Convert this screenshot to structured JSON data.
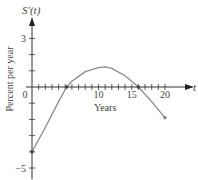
{
  "chart_data": {
    "type": "line",
    "title": "",
    "ylabel": "Percent per year",
    "xlabel": "Years",
    "y_axis_name": "S′(t)",
    "x_axis_name": "t",
    "xlim": [
      0,
      24
    ],
    "ylim": [
      -5.5,
      4
    ],
    "x_ticks": [
      0,
      1,
      2,
      3,
      4,
      5,
      6,
      7,
      8,
      9,
      10,
      11,
      12,
      13,
      14,
      15,
      16,
      17,
      18,
      19,
      20
    ],
    "x_tick_labels": [
      {
        "value": 0,
        "label": "0"
      },
      {
        "value": 10,
        "label": "10"
      },
      {
        "value": 15,
        "label": "15"
      },
      {
        "value": 20,
        "label": "20"
      }
    ],
    "y_ticks": [
      -5,
      -4,
      -3,
      -2,
      -1,
      0,
      1,
      2,
      3
    ],
    "y_tick_labels": [
      {
        "value": 3,
        "label": "3"
      },
      {
        "value": -5,
        "label": "−5"
      }
    ],
    "grid": false,
    "series": [
      {
        "name": "S'(t)",
        "x": [
          0,
          2,
          4,
          5.2,
          6,
          8,
          10,
          11,
          12,
          14,
          16,
          18,
          20
        ],
        "values": [
          -4.0,
          -2.5,
          -0.9,
          0.0,
          0.35,
          0.95,
          1.2,
          1.25,
          1.15,
          0.7,
          0.0,
          -0.9,
          -1.9
        ]
      }
    ],
    "points": [
      {
        "x": 0,
        "y": -4.0,
        "marker": "dot"
      },
      {
        "x": 5.2,
        "y": 0,
        "marker": "dot"
      },
      {
        "x": 16,
        "y": 0,
        "marker": "dot"
      },
      {
        "x": 20,
        "y": -1.9,
        "marker": "dot"
      }
    ],
    "colors": {
      "curve": "#8a8a8a",
      "axis": "#333333"
    }
  }
}
